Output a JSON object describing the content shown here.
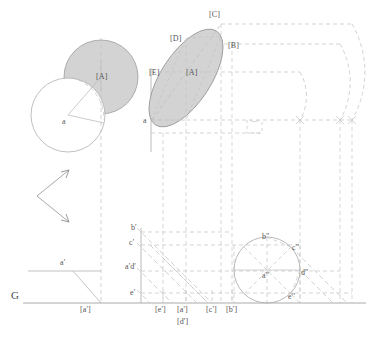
{
  "figure": {
    "title_ground_line_label": "G",
    "colors": {
      "fill_gray": "#d3d3d3",
      "outline_gray": "#9a9a9a",
      "dash_gray": "#b9b9b9",
      "solid_gray": "#a8a8a8",
      "text_gray": "#555555",
      "background": "#ffffff"
    },
    "top_left_view": {
      "name": "plan-rotation-view",
      "labels": [
        {
          "text": "[A]",
          "x": 96,
          "y": 73
        },
        {
          "text": "a",
          "x": 62,
          "y": 118
        }
      ],
      "shaded_circle": {
        "cx": 101,
        "cy": 77,
        "r": 37
      },
      "white_circle": {
        "cx": 68,
        "cy": 115,
        "r": 37
      }
    },
    "top_right_view": {
      "name": "ellipse-projection-view",
      "labels": [
        {
          "text": "[C]",
          "x": 209,
          "y": 11
        },
        {
          "text": "[D]",
          "x": 170,
          "y": 35
        },
        {
          "text": "[B]",
          "x": 228,
          "y": 42
        },
        {
          "text": "[E]",
          "x": 149,
          "y": 69
        },
        {
          "text": "[A]",
          "x": 186,
          "y": 69
        },
        {
          "text": "a",
          "x": 143,
          "y": 117
        }
      ]
    },
    "arrows": {
      "name": "direction-arrows",
      "count": 2
    },
    "bottom_left_view": {
      "name": "front-elevation-view",
      "labels": [
        {
          "text": "a'",
          "x": 60,
          "y": 259
        }
      ]
    },
    "elevation_labels": [
      {
        "text": "b'",
        "x": 131,
        "y": 224
      },
      {
        "text": "c'",
        "x": 129,
        "y": 239
      },
      {
        "text": "a'd'",
        "x": 128,
        "y": 263
      },
      {
        "text": "e'",
        "x": 130,
        "y": 289
      }
    ],
    "auxiliary_circle_labels": [
      {
        "text": "b\"",
        "x": 262,
        "y": 235
      },
      {
        "text": "c\"",
        "x": 292,
        "y": 246
      },
      {
        "text": "d\"",
        "x": 301,
        "y": 271
      },
      {
        "text": "a\"",
        "x": 264,
        "y": 274
      },
      {
        "text": "e\"",
        "x": 290,
        "y": 296
      }
    ],
    "ground_line_labels": [
      {
        "text": "[a']",
        "x": 80,
        "y": 313
      },
      {
        "text": "[e']",
        "x": 155,
        "y": 313
      },
      {
        "text": "[a']",
        "x": 177,
        "y": 313
      },
      {
        "text": "[d']",
        "x": 177,
        "y": 325
      },
      {
        "text": "[c']",
        "x": 206,
        "y": 313
      },
      {
        "text": "[b']",
        "x": 226,
        "y": 313
      }
    ],
    "ground_line": {
      "label": "G",
      "label_x": 11,
      "label_y": 296,
      "y": 303
    }
  }
}
